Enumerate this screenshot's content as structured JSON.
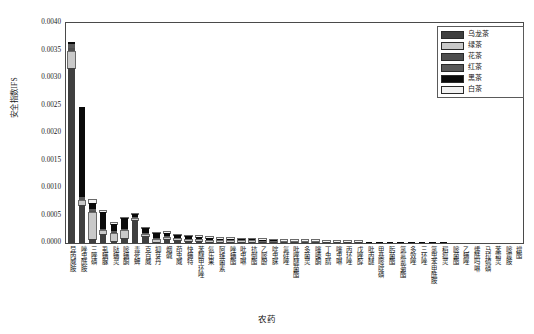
{
  "chart_data": {
    "type": "bar",
    "subtype": "stacked-bar",
    "title": "",
    "xlabel": "农药",
    "ylabel": "安全指数IFS",
    "ylim": [
      0.0,
      0.004
    ],
    "yticks": [
      "0.0000",
      "0.0005",
      "0.0010",
      "0.0015",
      "0.0020",
      "0.0025",
      "0.0030",
      "0.0035",
      "0.0040"
    ],
    "ytick_values": [
      0.0,
      0.0005,
      0.001,
      0.0015,
      0.002,
      0.0025,
      0.003,
      0.0035,
      0.004
    ],
    "grid": false,
    "legend_position": "top-right",
    "categories": [
      "异丙威胺",
      "唑虫酰胺",
      "三唑磷",
      "虱螨脲",
      "哒螨灵",
      "嘧螨酮",
      "毒死蜱",
      "克百威",
      "抑芽丹",
      "烟碱",
      "茚虫威",
      "快螨特",
      "苯醚甲环唑",
      "氨乐果",
      "阿维菌素",
      "唑螨酯",
      "吡虫啉",
      "抗倒酯",
      "乙嘧酚",
      "啶虫脒",
      "氟硅唑",
      "吡唑醚菌酯",
      "多菌灵",
      "噻嗪酮",
      "丁虫腈",
      "噻虫啉",
      "丙环唑",
      "戊唑醇",
      "吡丙醚",
      "甲基嘧啶磷",
      "肟菌酯",
      "氯氟氰菊酯",
      "多效唑",
      "三环唑",
      "氯虫苯甲酰胺",
      "稻瘟灵",
      "嘧菌酯",
      "乙螨唑",
      "烯酰吗啉",
      "马拉硫磷",
      "苯霜灵",
      "嘧霉胺",
      "增酯"
    ],
    "series": [
      {
        "name": "乌龙茶",
        "color": "#3f3f3f",
        "values": [
          0.00318,
          0.00069,
          7e-05,
          0.00016,
          3e-05,
          0.0001,
          0.00041,
          0.00013,
          2e-05,
          7e-05,
          5e-05,
          4e-05,
          3e-05,
          2e-05,
          2e-05,
          2e-05,
          2e-05,
          2e-05,
          1e-05,
          1e-05,
          1e-05,
          1e-05,
          1e-05,
          1e-05,
          1e-05,
          1e-05,
          1e-05,
          1e-05,
          0.0,
          0.0,
          0.0,
          0.0,
          0.0,
          0.0,
          0.0,
          0.0,
          0.0,
          0.0,
          0.0,
          0.0,
          0.0,
          0.0,
          0.0
        ]
      },
      {
        "name": "绿茶",
        "color": "#c9c9c9",
        "values": [
          0.0003,
          8e-05,
          0.00048,
          5e-05,
          0.00014,
          0.00012,
          2e-05,
          2e-05,
          4e-05,
          2e-05,
          2e-05,
          2e-05,
          2e-05,
          2e-05,
          1e-05,
          1e-05,
          1e-05,
          1e-05,
          1e-05,
          1e-05,
          1e-05,
          1e-05,
          1e-05,
          1e-05,
          0.0,
          0.0,
          0.0,
          0.0,
          0.0,
          0.0,
          0.0,
          0.0,
          0.0,
          0.0,
          0.0,
          0.0,
          0.0,
          0.0,
          0.0,
          0.0,
          0.0,
          0.0,
          0.0
        ]
      },
      {
        "name": "花茶",
        "color": "#4e4e4e",
        "values": [
          6e-05,
          2e-05,
          3e-05,
          3e-05,
          3e-05,
          2e-05,
          2e-05,
          2e-05,
          2e-05,
          2e-05,
          1e-05,
          1e-05,
          1e-05,
          1e-05,
          1e-05,
          1e-05,
          1e-05,
          1e-05,
          1e-05,
          1e-05,
          0.0,
          0.0,
          0.0,
          0.0,
          0.0,
          0.0,
          0.0,
          0.0,
          0.0,
          0.0,
          0.0,
          0.0,
          0.0,
          0.0,
          0.0,
          0.0,
          0.0,
          0.0,
          0.0,
          0.0,
          0.0,
          0.0,
          0.0
        ]
      },
      {
        "name": "红茶",
        "color": "#595959",
        "values": [
          8e-05,
          4e-05,
          3e-05,
          2e-05,
          2e-05,
          2e-05,
          2e-05,
          2e-05,
          2e-05,
          2e-05,
          1e-05,
          1e-05,
          1e-05,
          1e-05,
          1e-05,
          1e-05,
          1e-05,
          1e-05,
          1e-05,
          0.0,
          0.0,
          0.0,
          0.0,
          0.0,
          0.0,
          0.0,
          0.0,
          0.0,
          0.0,
          0.0,
          0.0,
          0.0,
          0.0,
          0.0,
          0.0,
          0.0,
          0.0,
          0.0,
          0.0,
          0.0,
          0.0,
          0.0,
          0.0
        ]
      },
      {
        "name": "黑茶",
        "color": "#0a0a0a",
        "values": [
          3e-05,
          0.00164,
          0.00012,
          0.0003,
          0.00013,
          0.00019,
          5e-05,
          8e-05,
          8e-05,
          6e-05,
          5e-05,
          4e-05,
          4e-05,
          4e-05,
          3e-05,
          3e-05,
          2e-05,
          2e-05,
          2e-05,
          2e-05,
          2e-05,
          2e-05,
          2e-05,
          2e-05,
          1e-05,
          1e-05,
          1e-05,
          1e-05,
          1e-05,
          1e-05,
          1e-05,
          1e-05,
          1e-05,
          1e-05,
          1e-05,
          1e-05,
          0.0,
          0.0,
          0.0,
          0.0,
          0.0,
          0.0,
          0.0
        ]
      },
      {
        "name": "白茶",
        "color": "#f2f2f2",
        "values": [
          0.0,
          0.0,
          5e-05,
          2e-05,
          2e-05,
          1e-05,
          1e-05,
          1e-05,
          1e-05,
          1e-05,
          1e-05,
          1e-05,
          1e-05,
          1e-05,
          1e-05,
          1e-05,
          1e-05,
          1e-05,
          1e-05,
          1e-05,
          1e-05,
          1e-05,
          1e-05,
          1e-05,
          1e-05,
          1e-05,
          1e-05,
          1e-05,
          0.0,
          0.0,
          0.0,
          0.0,
          0.0,
          0.0,
          0.0,
          0.0,
          0.0,
          0.0,
          0.0,
          0.0,
          0.0,
          0.0,
          0.0
        ]
      }
    ],
    "totals": [
      0.00365,
      0.00247,
      0.00078,
      0.00058,
      0.00037,
      0.00046,
      0.00053,
      0.00028,
      0.00019,
      0.0002,
      0.00015,
      0.00013,
      0.00012,
      0.00011,
      9e-05,
      9e-05,
      8e-05,
      8e-05,
      7e-05,
      6e-05,
      5e-05,
      5e-05,
      5e-05,
      5e-05,
      3e-05,
      3e-05,
      3e-05,
      3e-05,
      2e-05,
      2e-05,
      2e-05,
      2e-05,
      2e-05,
      2e-05,
      2e-05,
      2e-05,
      1e-05,
      1e-05,
      1e-05,
      1e-05,
      1e-05,
      1e-05,
      1e-05
    ]
  },
  "legend": {
    "items": [
      {
        "label": "乌龙茶",
        "color": "#3f3f3f"
      },
      {
        "label": "绿茶",
        "color": "#c9c9c9"
      },
      {
        "label": "花茶",
        "color": "#4e4e4e"
      },
      {
        "label": "红茶",
        "color": "#595959"
      },
      {
        "label": "黑茶",
        "color": "#0a0a0a"
      },
      {
        "label": "白茶",
        "color": "#f2f2f2"
      }
    ]
  },
  "axes": {
    "y_title": "安全指数IFS",
    "x_title": "农药"
  }
}
